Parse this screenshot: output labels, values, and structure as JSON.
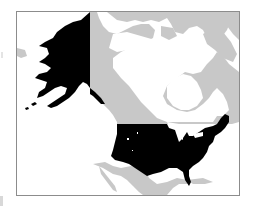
{
  "map": {
    "type": "locator-map",
    "region": "North America",
    "highlighted": [
      "United States (contiguous)",
      "Alaska"
    ],
    "colors": {
      "highlight": "#000000",
      "other_land": "#c8c8c8",
      "water": "#ffffff",
      "frame": "#8c8c8c"
    },
    "legend": [],
    "labels": []
  }
}
